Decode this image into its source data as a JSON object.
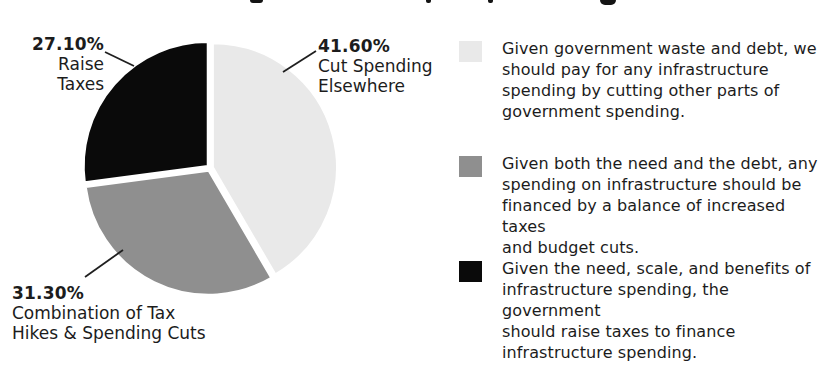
{
  "page": {
    "background": "#ffffff"
  },
  "chart_data": {
    "type": "pie",
    "title": "",
    "start_angle": "top",
    "direction": "clockwise",
    "legend_position": "right",
    "labels_on_chart": true,
    "slices": [
      {
        "label": "Cut Spending Elsewhere",
        "value": 41.6,
        "display": "41.60%",
        "color": "#e9e9e9"
      },
      {
        "label": "Combination of Tax Hikes & Spending Cuts",
        "value": 31.3,
        "display": "31.30%",
        "color": "#8f8f8f"
      },
      {
        "label": "Raise Taxes",
        "value": 27.1,
        "display": "27.10%",
        "color": "#0a0a0a"
      }
    ]
  },
  "callouts": [
    {
      "for": "raise-taxes",
      "pct": "27.10%",
      "lines": [
        "Raise Taxes"
      ]
    },
    {
      "for": "cut-spending-elsewhere",
      "pct": "41.60%",
      "lines": [
        "Cut Spending",
        "Elsewhere"
      ]
    },
    {
      "for": "combination-of-tax-hikes-and-spending-cuts",
      "pct": "31.30%",
      "lines": [
        "Combination of Tax",
        "Hikes & Spending Cuts"
      ]
    }
  ],
  "legend": {
    "items": [
      {
        "color": "#e9e9e9",
        "text": "Given government waste and debt, we should pay for any infrastructure spending by cutting other parts of government spending.",
        "lines": [
          "Given government waste and debt, we",
          "should pay for any infrastructure",
          "spending by cutting other parts of",
          "government spending."
        ]
      },
      {
        "color": "#8f8f8f",
        "text": "Given both the need and the debt, any spending on infrastructure should be financed by a balance of increased taxes and budget cuts.",
        "lines": [
          "Given both the need and the debt, any",
          "spending on infrastructure should be",
          "financed by a balance of increased taxes",
          "and budget cuts."
        ]
      },
      {
        "color": "#0a0a0a",
        "text": "Given the need, scale, and benefits of infrastructure spending, the government should raise taxes to finance infrastructure spending.",
        "lines": [
          "Given the need, scale, and benefits of",
          "infrastructure spending, the government",
          "should raise taxes to finance",
          "infrastructure spending."
        ]
      }
    ]
  }
}
